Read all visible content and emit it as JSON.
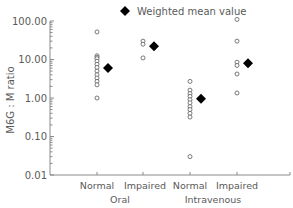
{
  "chart_data": {
    "type": "scatter",
    "title": "",
    "xlabel": "",
    "ylabel": "M6G : M ratio",
    "yscale": "log",
    "ylim": [
      0.01,
      100
    ],
    "y_ticks": [
      "100.00",
      "10.00",
      "1.00",
      "0.10",
      "0.01"
    ],
    "y_tick_values": [
      100,
      10,
      1,
      0.1,
      0.01
    ],
    "grid": false,
    "legend": {
      "position": "top",
      "entries": [
        {
          "label": "Weighted mean value",
          "marker": "filled-diamond"
        }
      ]
    },
    "categories": [
      "Normal",
      "Impaired",
      "Normal",
      "Impaired"
    ],
    "groups": [
      {
        "label": "Oral",
        "categories": [
          "Normal",
          "Impaired"
        ]
      },
      {
        "label": "Intravenous",
        "categories": [
          "Normal",
          "Impaired"
        ]
      }
    ],
    "series": [
      {
        "name": "Individual values",
        "marker": "open-circle",
        "points": [
          {
            "category_index": 0,
            "values": [
              52,
              12.5,
              11.5,
              10.5,
              9,
              7.5,
              6.2,
              5,
              4,
              3.3,
              2.7,
              2.2,
              1.0
            ]
          },
          {
            "category_index": 1,
            "values": [
              30,
              25,
              11
            ]
          },
          {
            "category_index": 2,
            "values": [
              2.7,
              1.6,
              1.3,
              1.1,
              0.9,
              0.75,
              0.6,
              0.5,
              0.4,
              0.32,
              0.03
            ]
          },
          {
            "category_index": 3,
            "values": [
              110,
              30,
              8.5,
              7,
              4.2,
              1.35
            ]
          }
        ]
      },
      {
        "name": "Weighted mean value",
        "marker": "filled-diamond",
        "values": [
          6.0,
          22,
          0.95,
          8.0
        ]
      }
    ]
  },
  "legend": {
    "label": "Weighted mean value"
  },
  "axis": {
    "ylabel": "M6G : M ratio",
    "yticks": [
      "100.00",
      "10.00",
      "1.00",
      "0.10",
      "0.01"
    ],
    "xcats": [
      "Normal",
      "Impaired",
      "Normal",
      "Impaired"
    ],
    "groups": [
      "Oral",
      "Intravenous"
    ]
  }
}
